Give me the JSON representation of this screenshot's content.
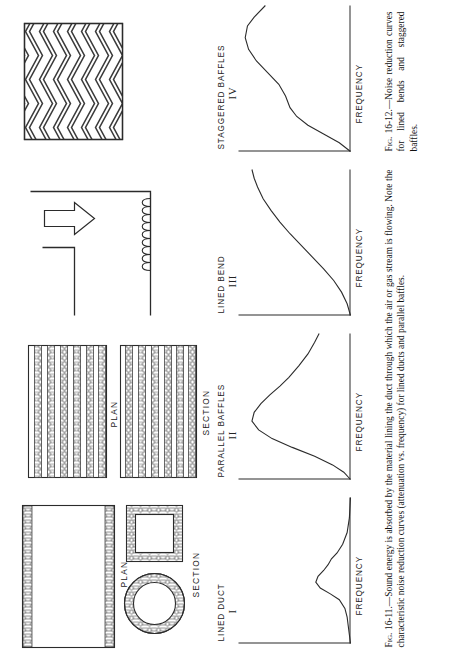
{
  "page": {
    "orientation": "rotated-90-ccw",
    "background": "#ffffff",
    "ink": "#232323"
  },
  "figures": [
    {
      "id": "fig-16-11",
      "number": "Fig. 16-11.",
      "caption_prefix": "Fig. 16-11.",
      "caption_text": "—Sound energy is absorbed by the material lining the duct through which the air or gas stream is flowing.  Note the characteristic noise reduction curves (attenuation vs. frequency) for lined ducts and parallel baffles.",
      "caption_full": "Fig. 16-11.—Sound energy is absorbed by the material lining the duct through which the air or gas stream is flowing.  Note the characteristic noise reduction curves (attenuation vs. frequency) for lined ducts and parallel baffles."
    },
    {
      "id": "fig-16-12",
      "number": "Fig. 16-12.",
      "caption_prefix": "Fig. 16-12.",
      "caption_text": "—Noise reduction curves for lined bends and staggered baffles.",
      "caption_full": "Fig. 16-12.—Noise reduction curves for lined bends and staggered baffles."
    }
  ],
  "diagrams": [
    {
      "id": "lined-duct",
      "view_labels": [
        "PLAN",
        "SECTION"
      ],
      "description": "Lined duct: plan view rectangle with acoustic lining on both long walls; section views show round duct and square duct with lining around perimeter."
    },
    {
      "id": "parallel-baffles",
      "view_labels": [
        "PLAN",
        "SECTION"
      ],
      "description": "Parallel baffles: plan and section views showing evenly spaced horizontal absorptive baffles."
    },
    {
      "id": "lined-bend",
      "view_labels": [],
      "description": "Lined bend: right-angle elbow duct with acoustic lining on the outer turn and a flow-direction arrow."
    },
    {
      "id": "staggered-baffles",
      "view_labels": [],
      "description": "Staggered baffles: rectangular enclosure filled with chevron/zigzag staggered absorptive baffles."
    }
  ],
  "chart_data": [
    {
      "type": "line",
      "id": "chart-I",
      "title": "LINED DUCT",
      "numeral": "I",
      "xlabel": "FREQUENCY",
      "ylabel": "",
      "xlim": [
        0,
        100
      ],
      "ylim": [
        0,
        100
      ],
      "grid": false,
      "legend": null,
      "series": [
        {
          "name": "noise reduction",
          "x": [
            0,
            6,
            12,
            18,
            24,
            30,
            34,
            38,
            42,
            46,
            50,
            54,
            58,
            62,
            68,
            76,
            86,
            100
          ],
          "y": [
            0,
            1,
            2,
            3,
            5,
            10,
            18,
            27,
            31,
            29,
            24,
            20,
            17,
            12,
            7,
            3,
            1,
            0
          ]
        }
      ],
      "annotation": "Narrow attenuation peak at mid frequency, low amplitude."
    },
    {
      "type": "line",
      "id": "chart-II",
      "title": "PARALLEL BAFFLES",
      "numeral": "II",
      "xlabel": "FREQUENCY",
      "ylabel": "",
      "xlim": [
        0,
        100
      ],
      "ylim": [
        0,
        100
      ],
      "grid": false,
      "legend": null,
      "series": [
        {
          "name": "noise reduction",
          "x": [
            0,
            5,
            10,
            16,
            22,
            28,
            34,
            40,
            46,
            52,
            58,
            64,
            70,
            78,
            86,
            94,
            100
          ],
          "y": [
            0,
            6,
            16,
            32,
            52,
            70,
            82,
            88,
            86,
            80,
            72,
            63,
            55,
            46,
            38,
            32,
            28
          ]
        }
      ],
      "annotation": "Broad high bell-shaped attenuation peak."
    },
    {
      "type": "line",
      "id": "chart-III",
      "title": "LINED BEND",
      "numeral": "III",
      "xlabel": "FREQUENCY",
      "ylabel": "",
      "xlim": [
        0,
        100
      ],
      "ylim": [
        0,
        100
      ],
      "grid": false,
      "legend": null,
      "series": [
        {
          "name": "noise reduction",
          "x": [
            0,
            8,
            16,
            24,
            32,
            40,
            48,
            56,
            64,
            72,
            80,
            88,
            94,
            100
          ],
          "y": [
            0,
            3,
            8,
            15,
            24,
            34,
            44,
            54,
            63,
            71,
            78,
            83,
            86,
            88
          ]
        }
      ],
      "annotation": "Monotonically rising attenuation with frequency."
    },
    {
      "type": "line",
      "id": "chart-IV",
      "title": "STAGGERED BAFFLES",
      "numeral": "IV",
      "xlabel": "FREQUENCY",
      "ylabel": "",
      "xlim": [
        0,
        100
      ],
      "ylim": [
        0,
        100
      ],
      "grid": false,
      "legend": null,
      "series": [
        {
          "name": "noise reduction",
          "x": [
            0,
            6,
            12,
            18,
            24,
            30,
            38,
            46,
            54,
            62,
            70,
            78,
            86,
            92,
            100
          ],
          "y": [
            0,
            10,
            24,
            38,
            48,
            54,
            58,
            64,
            74,
            84,
            91,
            94,
            92,
            86,
            76
          ]
        }
      ],
      "annotation": "Rises quickly, slight shelf, then broad high plateau falling at top end."
    }
  ]
}
